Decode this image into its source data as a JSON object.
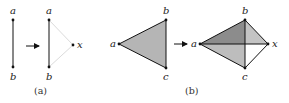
{
  "figure": {
    "panel_a": {
      "caption": "(a)",
      "before": {
        "vertices": [
          {
            "label": "a",
            "x": 13,
            "y": 20
          },
          {
            "label": "b",
            "x": 13,
            "y": 67
          }
        ],
        "edges": [
          [
            "a",
            "b"
          ]
        ]
      },
      "after": {
        "vertices": [
          {
            "label": "a",
            "x": 49,
            "y": 20
          },
          {
            "label": "b",
            "x": 49,
            "y": 67
          },
          {
            "label": "x",
            "x": 73,
            "y": 45
          }
        ],
        "edges": [
          [
            "a",
            "b"
          ]
        ],
        "faint_edges": [
          [
            "a",
            "x"
          ],
          [
            "b",
            "x"
          ]
        ]
      }
    },
    "panel_b": {
      "caption": "(b)",
      "before": {
        "vertices": [
          {
            "label": "a",
            "x": 119,
            "y": 44
          },
          {
            "label": "b",
            "x": 166,
            "y": 20
          },
          {
            "label": "c",
            "x": 166,
            "y": 68
          }
        ],
        "faces": [
          [
            "a",
            "b",
            "c"
          ]
        ]
      },
      "after": {
        "vertices": [
          {
            "label": "a",
            "x": 200,
            "y": 44
          },
          {
            "label": "b",
            "x": 245,
            "y": 20
          },
          {
            "label": "c",
            "x": 245,
            "y": 68
          },
          {
            "label": "x",
            "x": 268,
            "y": 44
          }
        ],
        "faces": [
          [
            "a",
            "b",
            "c"
          ],
          [
            "b",
            "c",
            "x"
          ]
        ]
      }
    },
    "colors": {
      "edge": "#111111",
      "faint_edge": "#d0d0d0",
      "face_single": "#b5b5b5",
      "face_dark": "#8c8c8c",
      "face_mid": "#bdbdbd",
      "face_light": "#c4c4c4",
      "face_white": "#ffffff"
    },
    "arrow_symbol": "right-arrow"
  }
}
